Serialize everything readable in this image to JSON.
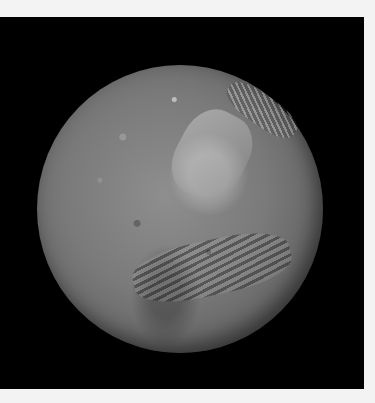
{
  "image": {
    "subject": "moon-planetary-body",
    "background_color": "#000000",
    "border_color": "#f3f3f3",
    "surface_tone": "#7a7a7a"
  }
}
